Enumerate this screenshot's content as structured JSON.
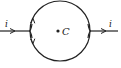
{
  "diagram": {
    "type": "circuit-loop",
    "labels": {
      "current_in": "i",
      "current_out": "i",
      "center": "C"
    },
    "colors": {
      "stroke": "#222222",
      "background": "#ffffff"
    }
  }
}
